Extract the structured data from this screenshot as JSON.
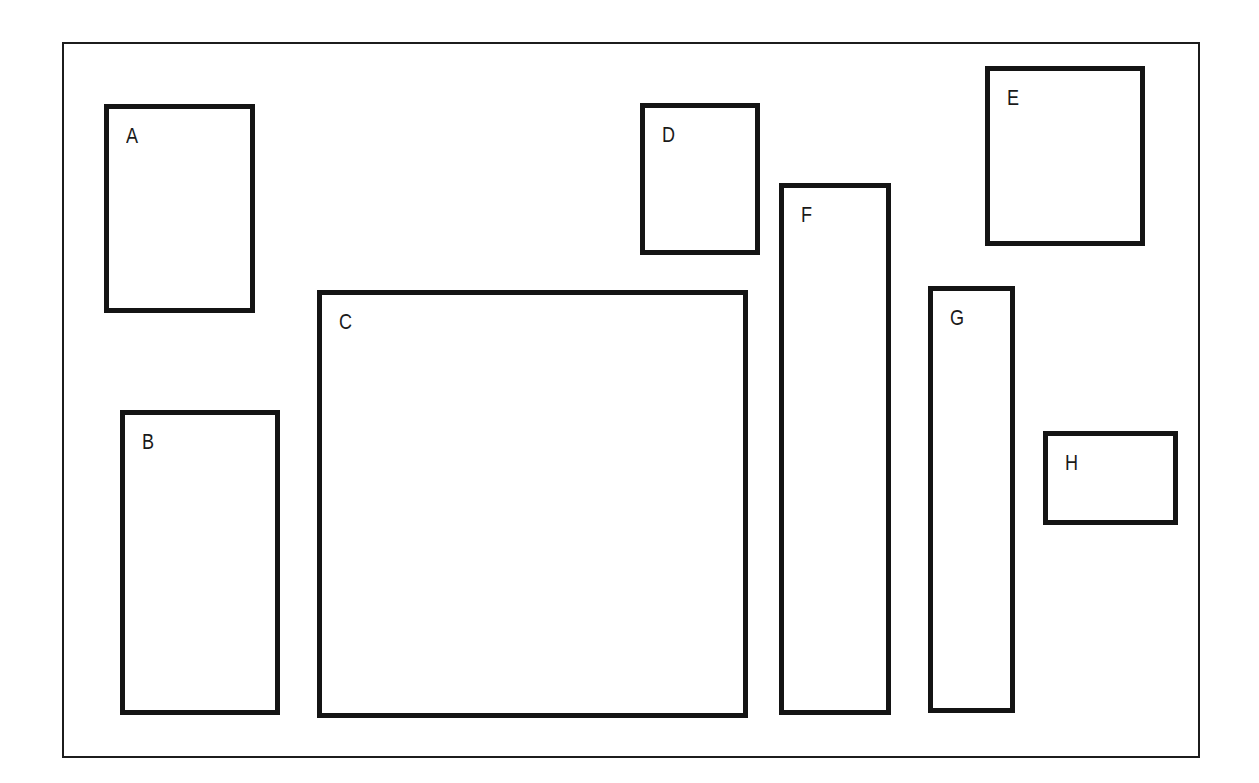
{
  "figure": {
    "kind": "labeled-rectangles-diagram",
    "colors": {
      "box_border": "#141414",
      "frame_border": "#1c1c1c",
      "background": "#ffffff",
      "label_text": "#1a1a1a"
    }
  },
  "boxes": [
    {
      "id": "box-a",
      "label": "A"
    },
    {
      "id": "box-b",
      "label": "B"
    },
    {
      "id": "box-c",
      "label": "C"
    },
    {
      "id": "box-d",
      "label": "D"
    },
    {
      "id": "box-e",
      "label": "E"
    },
    {
      "id": "box-f",
      "label": "F"
    },
    {
      "id": "box-g",
      "label": "G"
    },
    {
      "id": "box-h",
      "label": "H"
    }
  ]
}
